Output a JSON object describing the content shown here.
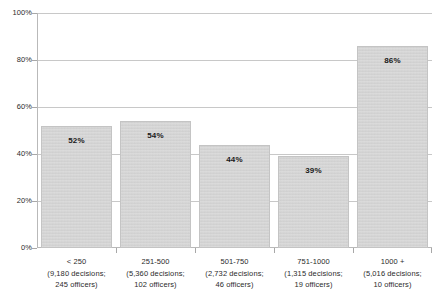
{
  "chart_data": {
    "type": "bar",
    "title": "",
    "subtitle": "",
    "xlabel": "",
    "ylabel": "",
    "ylim": [
      0,
      100
    ],
    "grid": true,
    "legend": false,
    "categories": [
      "< 250",
      "251-500",
      "501-750",
      "751-1000",
      "1000 +"
    ],
    "category_sublabels": [
      [
        "(9,180 decisions;",
        "245 officers)"
      ],
      [
        "(5,360 decisions;",
        "102 officers)"
      ],
      [
        "(2,732 decisions;",
        "46 officers)"
      ],
      [
        "(1,315 decisions;",
        "19 officers)"
      ],
      [
        "(5,016 decisions;",
        "10 officers)"
      ]
    ],
    "values": [
      52,
      54,
      44,
      39,
      86
    ],
    "data_labels": [
      "52%",
      "54%",
      "44%",
      "39%",
      "86%"
    ],
    "ytick_labels": [
      "100%",
      "80%",
      "60%",
      "40%",
      "20%",
      "0%"
    ],
    "ytick_values": [
      100,
      80,
      60,
      40,
      20,
      0
    ],
    "colors": {
      "bar_fill": "#d2d2d2",
      "bar_border": "#c4c4c4",
      "gridline": "#c8c8c8",
      "axis": "#b9b9b9",
      "text": "#2b2b2b",
      "background": "#ffffff"
    }
  }
}
